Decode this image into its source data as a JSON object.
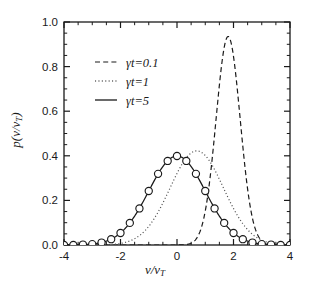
{
  "figure": {
    "background": "#ffffff",
    "ink": "#1a1a1a",
    "width": 310,
    "height": 291
  },
  "axes": {
    "x_label_main": "v/v",
    "x_label_sub": "T",
    "y_label_main": "p(v/v",
    "y_label_sub": "T",
    "y_label_close": ")",
    "x_ticklabels": [
      "-4",
      "-2",
      "0",
      "2",
      "4"
    ],
    "y_ticklabels": [
      "0.0",
      "0.2",
      "0.4",
      "0.6",
      "0.8",
      "1.0"
    ]
  },
  "legend": {
    "entries": [
      {
        "label": "γt=0.1",
        "style": "dashed"
      },
      {
        "label": "γt=1",
        "style": "dotted"
      },
      {
        "label": "γt=5",
        "style": "solid"
      }
    ]
  },
  "chart_data": {
    "type": "line",
    "title": "",
    "xlabel": "v/v_T",
    "ylabel": "p(v/v_T)",
    "xlim": [
      -4,
      4
    ],
    "ylim": [
      0,
      1.0
    ],
    "xticks": [
      -4,
      -2,
      0,
      2,
      4
    ],
    "yticks": [
      0.0,
      0.2,
      0.4,
      0.6,
      0.8,
      1.0
    ],
    "xminor_step": 0.5,
    "yminor_step": 0.05,
    "grid": false,
    "legend_position": "upper-left",
    "series": [
      {
        "name": "γt=0.1",
        "style": "dashed",
        "color": "#1a1a1a",
        "markers": false,
        "model": "gaussian",
        "mean": 1.81,
        "sigma": 0.425,
        "peak": 0.935,
        "x": [
          -0.2,
          0.2,
          0.6,
          0.8,
          1.0,
          1.2,
          1.4,
          1.6,
          1.81,
          2.0,
          2.2,
          2.4,
          2.6,
          2.8,
          3.2,
          3.6,
          4.0
        ],
        "y": [
          0.0,
          0.0,
          0.005,
          0.022,
          0.074,
          0.191,
          0.385,
          0.661,
          0.935,
          0.872,
          0.691,
          0.445,
          0.237,
          0.105,
          0.01,
          0.0,
          0.0
        ]
      },
      {
        "name": "γt=1",
        "style": "dotted",
        "color": "#555555",
        "markers": false,
        "model": "gaussian",
        "mean": 0.7,
        "sigma": 0.945,
        "peak": 0.422,
        "x": [
          -4.0,
          -3.0,
          -2.5,
          -2.0,
          -1.5,
          -1.0,
          -0.5,
          0.0,
          0.35,
          0.7,
          1.0,
          1.5,
          2.0,
          2.5,
          3.0,
          3.5,
          4.0
        ],
        "y": [
          0.0,
          0.0,
          0.001,
          0.006,
          0.021,
          0.06,
          0.131,
          0.224,
          0.317,
          0.422,
          0.405,
          0.3,
          0.181,
          0.088,
          0.034,
          0.01,
          0.002
        ]
      },
      {
        "name": "γt=5",
        "style": "solid",
        "color": "#1a1a1a",
        "markers": true,
        "marker_symbol": "open-circle",
        "model": "gaussian",
        "mean": 0.0,
        "sigma": 1.0,
        "peak": 0.399,
        "x": [
          -4.0,
          -3.67,
          -3.33,
          -3.0,
          -2.67,
          -2.33,
          -2.0,
          -1.67,
          -1.33,
          -1.0,
          -0.67,
          -0.33,
          0.0,
          0.33,
          0.67,
          1.0,
          1.33,
          1.67,
          2.0,
          2.33,
          2.67,
          3.0,
          3.33,
          3.67,
          4.0
        ],
        "y": [
          0.0,
          0.0,
          0.002,
          0.004,
          0.011,
          0.026,
          0.054,
          0.099,
          0.164,
          0.242,
          0.319,
          0.377,
          0.399,
          0.377,
          0.319,
          0.242,
          0.164,
          0.099,
          0.054,
          0.026,
          0.011,
          0.004,
          0.002,
          0.0,
          0.0
        ]
      }
    ]
  }
}
